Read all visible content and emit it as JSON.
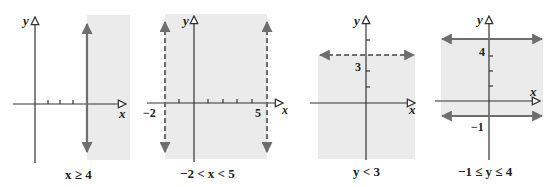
{
  "colors": {
    "shade": "#ebebeb",
    "axis": "#333333",
    "boundary": "#6e6e6e",
    "text": "#222222"
  },
  "panels": [
    {
      "caption": "x ≥ 4",
      "x_label": "x",
      "y_label": "y",
      "boundary": {
        "type": "vertical",
        "value": 4,
        "style": "solid"
      },
      "shaded": "x >= 4",
      "tick_labels": []
    },
    {
      "caption": "−2 < x < 5",
      "x_label": "x",
      "y_label": "y",
      "boundary": [
        {
          "type": "vertical",
          "value": -2,
          "style": "dashed"
        },
        {
          "type": "vertical",
          "value": 5,
          "style": "dashed"
        }
      ],
      "shaded": "-2 < x < 5",
      "tick_labels": [
        "−2",
        "5"
      ]
    },
    {
      "caption": "y < 3",
      "x_label": "x",
      "y_label": "y",
      "boundary": {
        "type": "horizontal",
        "value": 3,
        "style": "dashed"
      },
      "shaded": "y < 3",
      "tick_labels": [
        "3"
      ]
    },
    {
      "caption": "−1 ≤ y ≤ 4",
      "x_label": "x",
      "y_label": "y",
      "boundary": [
        {
          "type": "horizontal",
          "value": 4,
          "style": "solid"
        },
        {
          "type": "horizontal",
          "value": -1,
          "style": "solid"
        }
      ],
      "shaded": "-1 <= y <= 4",
      "tick_labels": [
        "4",
        "−1"
      ]
    }
  ]
}
